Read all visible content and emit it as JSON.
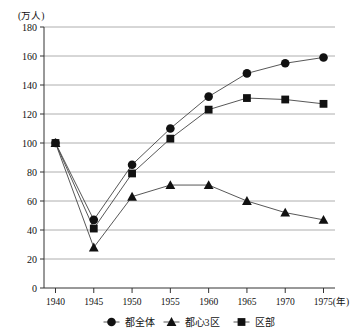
{
  "chart_data": {
    "type": "line",
    "title": "",
    "subtitle": "",
    "xlabel": "(年)",
    "ylabel": "(万人)",
    "unit_note": "(万人)",
    "x": [
      1940,
      1945,
      1950,
      1955,
      1960,
      1965,
      1970,
      1975
    ],
    "categories": [
      "1940",
      "1945",
      "1950",
      "1955",
      "1960",
      "1965",
      "1970",
      "1975"
    ],
    "xlim": [
      1938.5,
      1976.5
    ],
    "ylim": [
      0,
      180
    ],
    "ytick_step": 20,
    "yticks": [
      0,
      20,
      40,
      60,
      80,
      100,
      120,
      140,
      160,
      180
    ],
    "ytick_labels": [
      "0",
      "20",
      "40",
      "60",
      "80",
      "100",
      "120",
      "140",
      "160",
      "180"
    ],
    "xtick_labels": [
      "1940",
      "1945",
      "1950",
      "1955",
      "1960",
      "1965",
      "1970",
      "1975"
    ],
    "xaxis_suffix": "(年)",
    "grid": true,
    "grid_axis": "y",
    "legend_position": "bottom",
    "series": [
      {
        "name": "都全体",
        "marker": "circle",
        "color": "#111111",
        "values": [
          100,
          47,
          85,
          110,
          132,
          148,
          155,
          159
        ]
      },
      {
        "name": "都心3区",
        "marker": "triangle",
        "color": "#111111",
        "values": [
          100,
          28,
          63,
          71,
          71,
          60,
          52,
          47
        ]
      },
      {
        "name": "区部",
        "marker": "square",
        "color": "#111111",
        "values": [
          100,
          41,
          79,
          103,
          123,
          131,
          130,
          127
        ]
      }
    ]
  },
  "legend": {
    "items": [
      {
        "label": "都全体",
        "marker": "circle"
      },
      {
        "label": "都心3区",
        "marker": "triangle"
      },
      {
        "label": "区部",
        "marker": "square"
      }
    ]
  }
}
